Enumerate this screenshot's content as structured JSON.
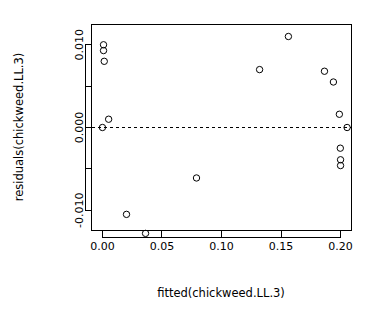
{
  "chart_data": {
    "type": "scatter",
    "title": "",
    "subtitle": "",
    "xlabel": "fitted(chickweed.LL.3)",
    "ylabel": "residuals(chickweed.LL.3)",
    "xlim": [
      -0.0092,
      0.2092
    ],
    "ylim": [
      -0.01245,
      0.01245
    ],
    "grid": false,
    "legend": null,
    "x_ticks": [
      {
        "value": 0.0,
        "label": "0.00"
      },
      {
        "value": 0.05,
        "label": "0.05"
      },
      {
        "value": 0.1,
        "label": "0.10"
      },
      {
        "value": 0.15,
        "label": "0.15"
      },
      {
        "value": 0.2,
        "label": "0.20"
      }
    ],
    "y_ticks": [
      {
        "value": 0.01,
        "label": "0.010"
      },
      {
        "value": 0.005,
        "label": ""
      },
      {
        "value": 0.0,
        "label": "0.000"
      },
      {
        "value": -0.005,
        "label": ""
      },
      {
        "value": -0.01,
        "label": "-0.010"
      }
    ],
    "reference_line": {
      "orientation": "horizontal",
      "value": 0.0,
      "style": "dashed"
    },
    "marker": {
      "shape": "open-circle",
      "radius": 3.2,
      "color": "#000000"
    },
    "points": [
      {
        "x": 0.0009,
        "y": 0.01
      },
      {
        "x": 0.0009,
        "y": 0.0093
      },
      {
        "x": 0.0015,
        "y": 0.008
      },
      {
        "x": 0.0,
        "y": 0.0
      },
      {
        "x": 0.0052,
        "y": 0.001
      },
      {
        "x": 0.0202,
        "y": -0.0105
      },
      {
        "x": 0.0362,
        "y": -0.0128
      },
      {
        "x": 0.079,
        "y": -0.0061
      },
      {
        "x": 0.132,
        "y": 0.007
      },
      {
        "x": 0.1562,
        "y": 0.011
      },
      {
        "x": 0.1865,
        "y": 0.0068
      },
      {
        "x": 0.194,
        "y": 0.0055
      },
      {
        "x": 0.199,
        "y": 0.0016
      },
      {
        "x": 0.2055,
        "y": 0.0
      },
      {
        "x": 0.1998,
        "y": -0.0025
      },
      {
        "x": 0.2,
        "y": -0.0039
      },
      {
        "x": 0.2,
        "y": -0.0046
      }
    ]
  }
}
